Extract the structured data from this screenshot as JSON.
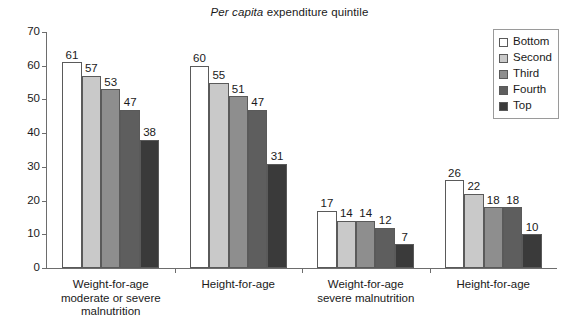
{
  "chart_data": {
    "type": "bar",
    "title": "Per capita expenditure quintile",
    "title_italic_prefix": "Per capita",
    "title_rest": " expenditure quintile",
    "xlabel": "",
    "ylabel": "",
    "ylim": [
      0,
      70
    ],
    "y_ticks": [
      0,
      10,
      20,
      30,
      40,
      50,
      60,
      70
    ],
    "grid": false,
    "legend_position": "top-right",
    "categories": [
      "Weight-for-age\nmoderate or severe\nmalnutrition",
      "Height-for-age",
      "Weight-for-age\nsevere malnutrition",
      "Height-for-age"
    ],
    "series": [
      {
        "name": "Bottom",
        "color": "#ffffff",
        "values": [
          61,
          60,
          17,
          26
        ]
      },
      {
        "name": "Second",
        "color": "#c9c9c9",
        "values": [
          57,
          55,
          14,
          22
        ]
      },
      {
        "name": "Third",
        "color": "#8e8e8e",
        "values": [
          53,
          51,
          14,
          18
        ]
      },
      {
        "name": "Fourth",
        "color": "#5e5e5e",
        "values": [
          47,
          47,
          12,
          18
        ]
      },
      {
        "name": "Top",
        "color": "#3a3a3a",
        "values": [
          38,
          31,
          7,
          10
        ]
      }
    ]
  },
  "legend": {
    "items": [
      {
        "label": "Bottom",
        "color": "#ffffff"
      },
      {
        "label": "Second",
        "color": "#c9c9c9"
      },
      {
        "label": "Third",
        "color": "#8e8e8e"
      },
      {
        "label": "Fourth",
        "color": "#5e5e5e"
      },
      {
        "label": "Top",
        "color": "#3a3a3a"
      }
    ]
  }
}
